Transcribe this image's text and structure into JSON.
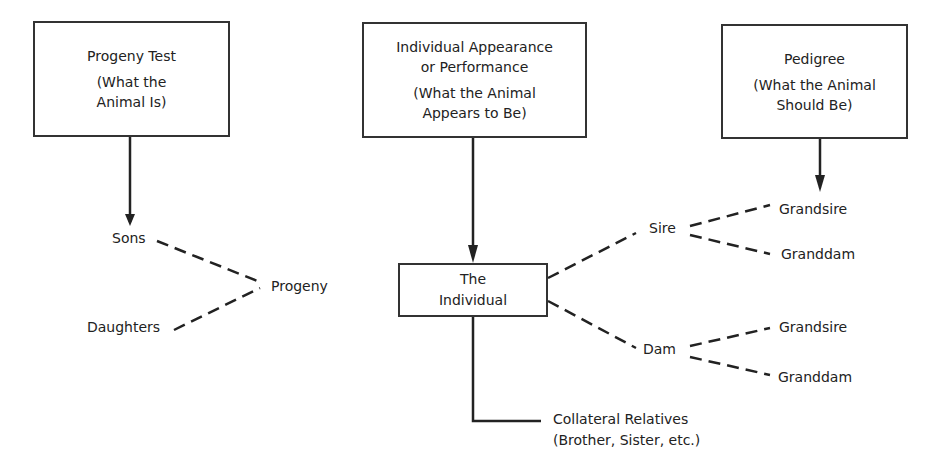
{
  "boxes": {
    "progeny_test": {
      "title": "Progeny Test",
      "subtitle_1": "(What the",
      "subtitle_2": "Animal Is)"
    },
    "individual_appearance": {
      "title_1": "Individual Appearance",
      "title_2": "or Performance",
      "subtitle_1": "(What the Animal",
      "subtitle_2": "Appears to Be)"
    },
    "pedigree": {
      "title": "Pedigree",
      "subtitle_1": "(What the Animal",
      "subtitle_2": "Should Be)"
    },
    "the_individual": {
      "line_1": "The",
      "line_2": "Individual"
    }
  },
  "labels": {
    "sons": "Sons",
    "daughters": "Daughters",
    "progeny": "Progeny",
    "sire": "Sire",
    "dam": "Dam",
    "sire_grandsire": "Grandsire",
    "sire_granddam": "Granddam",
    "dam_grandsire": "Grandsire",
    "dam_granddam": "Granddam",
    "collateral_1": "Collateral Relatives",
    "collateral_2": "(Brother, Sister, etc.)"
  },
  "colors": {
    "line": "#222222",
    "text": "#222222",
    "background": "#ffffff"
  }
}
